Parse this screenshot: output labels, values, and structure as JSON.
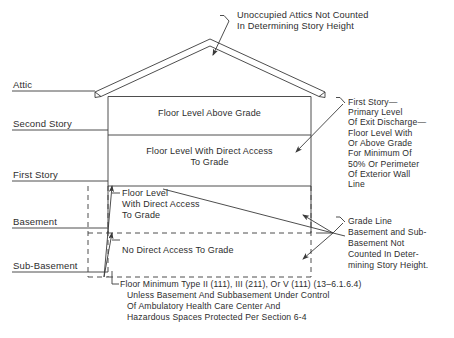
{
  "diagram": {
    "line_color": "#3a3a3a",
    "text_color": "#2d2d2d",
    "background": "#ffffff"
  },
  "top_note": {
    "line1": "Unoccupied Attics Not Counted",
    "line2": "In Determining Story Height"
  },
  "levels": [
    {
      "id": "attic",
      "label": "Attic"
    },
    {
      "id": "second-story",
      "label": "Second Story"
    },
    {
      "id": "first-story",
      "label": "First Story"
    },
    {
      "id": "basement",
      "label": "Basement"
    },
    {
      "id": "sub-basement",
      "label": "Sub-Basement"
    }
  ],
  "interior": {
    "above_grade": "Floor Level Above Grade",
    "direct_access_1": "Floor Level With Direct Access",
    "direct_access_2": "To Grade",
    "first_floor_1": "Floor Level",
    "first_floor_2": "With Direct Access",
    "first_floor_3": "To Grade",
    "no_access": "No Direct Access To Grade"
  },
  "callout_first_story": {
    "l1": "First Story—",
    "l2": "Primary Level",
    "l3": "Of Exit Discharge—",
    "l4": "Floor Level With",
    "l5": "Or Above Grade",
    "l6": "For Minimum Of",
    "l7": "50% Or Perimeter",
    "l8": "Of Exterior Wall",
    "l9": "Line"
  },
  "callout_grade_line": {
    "l1": "Grade Line",
    "l2": "Basement and Sub-",
    "l3": "Basement Not",
    "l4": "Counted In Deter-",
    "l5": "mining Story Height."
  },
  "footnote": {
    "l1": "Floor Minimum Type II (111), III (211), Or V (111) (13–6.1.6.4)",
    "l2": "Unless Basement And Subbasement Under Control",
    "l3": "Of Ambulatory Health Care Center And",
    "l4": "Hazardous Spaces Protected Per Section 6-4"
  }
}
